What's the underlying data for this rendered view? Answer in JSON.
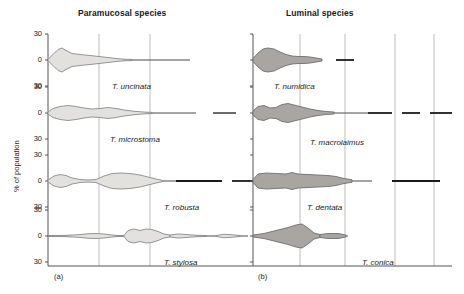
{
  "figure": {
    "width": 464,
    "height": 294,
    "y_axis_label": "% of population",
    "panels": [
      {
        "id": "a",
        "caption": "(a)",
        "title": "Paramucosal species",
        "fill_color": "#e3e1dd",
        "stroke_color": "#8a8a8a",
        "axis_x": 48,
        "right_x": 228,
        "gridlines": [
          99,
          150
        ],
        "rows": [
          {
            "species": "T. uncinata",
            "baseline_y": 60,
            "tick_labels": [
              "30",
              "0",
              "30"
            ],
            "label_x": 112,
            "label_y": 82,
            "profile": [
              {
                "x": 48,
                "w": 1.5
              },
              {
                "x": 53,
                "w": 11
              },
              {
                "x": 58,
                "w": 21
              },
              {
                "x": 62,
                "w": 24
              },
              {
                "x": 66,
                "w": 19
              },
              {
                "x": 72,
                "w": 13
              },
              {
                "x": 80,
                "w": 11
              },
              {
                "x": 90,
                "w": 9
              },
              {
                "x": 99,
                "w": 7
              },
              {
                "x": 108,
                "w": 5
              },
              {
                "x": 116,
                "w": 3
              },
              {
                "x": 124,
                "w": 1.6
              },
              {
                "x": 132,
                "w": 1.2
              }
            ],
            "line_end_x": 190
          },
          {
            "species": "T. microstoma",
            "baseline_y": 113,
            "tick_labels": [
              "30",
              "0",
              "30"
            ],
            "label_x": 110,
            "label_y": 135,
            "profile": [
              {
                "x": 48,
                "w": 2
              },
              {
                "x": 53,
                "w": 9
              },
              {
                "x": 60,
                "w": 13
              },
              {
                "x": 68,
                "w": 15
              },
              {
                "x": 76,
                "w": 13
              },
              {
                "x": 84,
                "w": 10
              },
              {
                "x": 92,
                "w": 8
              },
              {
                "x": 100,
                "w": 9
              },
              {
                "x": 108,
                "w": 11
              },
              {
                "x": 116,
                "w": 9
              },
              {
                "x": 124,
                "w": 6
              },
              {
                "x": 134,
                "w": 3.5
              },
              {
                "x": 144,
                "w": 1.8
              },
              {
                "x": 152,
                "w": 1.2
              }
            ],
            "line_end_x": 196,
            "extra_segments": [
              [
                213,
                236
              ]
            ]
          },
          {
            "species": "T. robusta",
            "baseline_y": 181,
            "tick_labels": [
              "30",
              "0",
              "30"
            ],
            "label_x": 164,
            "label_y": 203,
            "profile": [
              {
                "x": 48,
                "w": 2
              },
              {
                "x": 54,
                "w": 10
              },
              {
                "x": 60,
                "w": 13
              },
              {
                "x": 66,
                "w": 11
              },
              {
                "x": 72,
                "w": 6
              },
              {
                "x": 80,
                "w": 3
              },
              {
                "x": 88,
                "w": 2
              },
              {
                "x": 96,
                "w": 3
              },
              {
                "x": 104,
                "w": 10
              },
              {
                "x": 112,
                "w": 15
              },
              {
                "x": 120,
                "w": 16
              },
              {
                "x": 130,
                "w": 15
              },
              {
                "x": 140,
                "w": 12
              },
              {
                "x": 148,
                "w": 8
              },
              {
                "x": 156,
                "w": 4
              },
              {
                "x": 162,
                "w": 1.5
              }
            ],
            "line_end_x": 176,
            "dark_segments": [
              [
                176,
                222
              ],
              [
                232,
                260
              ]
            ]
          },
          {
            "species": "T. stylosa",
            "baseline_y": 236,
            "tick_labels": [
              "30",
              "0",
              "30"
            ],
            "label_x": 164,
            "label_y": 258,
            "profile": [
              {
                "x": 48,
                "w": 1
              },
              {
                "x": 64,
                "w": 1.2
              },
              {
                "x": 78,
                "w": 2.5
              },
              {
                "x": 88,
                "w": 4.5
              },
              {
                "x": 96,
                "w": 5
              },
              {
                "x": 104,
                "w": 4
              },
              {
                "x": 112,
                "w": 2
              },
              {
                "x": 118,
                "w": 1
              },
              {
                "x": 124,
                "w": 1
              }
            ],
            "profile2": [
              {
                "x": 124,
                "w": 1
              },
              {
                "x": 128,
                "w": 11
              },
              {
                "x": 134,
                "w": 14
              },
              {
                "x": 140,
                "w": 11
              },
              {
                "x": 146,
                "w": 14
              },
              {
                "x": 152,
                "w": 13
              },
              {
                "x": 158,
                "w": 9
              },
              {
                "x": 164,
                "w": 4
              },
              {
                "x": 170,
                "w": 2
              }
            ],
            "profile3": [
              {
                "x": 170,
                "w": 2
              },
              {
                "x": 178,
                "w": 4
              },
              {
                "x": 186,
                "w": 3
              },
              {
                "x": 196,
                "w": 1.5
              },
              {
                "x": 206,
                "w": 1
              }
            ],
            "profile4": [
              {
                "x": 216,
                "w": 1
              },
              {
                "x": 224,
                "w": 3.5
              },
              {
                "x": 232,
                "w": 2.5
              },
              {
                "x": 240,
                "w": 1
              }
            ],
            "line_end_x": 248
          }
        ]
      },
      {
        "id": "b",
        "caption": "(b)",
        "title": "Luminal species",
        "fill_color": "#a9a6a2",
        "stroke_color": "#6e6e6e",
        "axis_x": 253,
        "right_x": 450,
        "gridlines": [
          300,
          345,
          395,
          434
        ],
        "rows": [
          {
            "species": "T. numidica",
            "baseline_y": 60,
            "tick_labels": [
              "30",
              "0",
              "30"
            ],
            "label_x": 274,
            "label_y": 82,
            "profile": [
              {
                "x": 253,
                "w": 3
              },
              {
                "x": 258,
                "w": 14
              },
              {
                "x": 263,
                "w": 22
              },
              {
                "x": 268,
                "w": 24
              },
              {
                "x": 274,
                "w": 22
              },
              {
                "x": 280,
                "w": 16
              },
              {
                "x": 286,
                "w": 11
              },
              {
                "x": 292,
                "w": 8
              },
              {
                "x": 298,
                "w": 7
              },
              {
                "x": 304,
                "w": 7
              },
              {
                "x": 310,
                "w": 6
              },
              {
                "x": 316,
                "w": 4
              },
              {
                "x": 322,
                "w": 2
              }
            ],
            "line_end_x": 322,
            "dark_segments": [
              [
                336,
                354
              ]
            ]
          },
          {
            "species": "T. macrolaimus",
            "baseline_y": 113,
            "tick_labels": [
              "30",
              "0",
              "30"
            ],
            "label_x": 310,
            "label_y": 138,
            "profile": [
              {
                "x": 253,
                "w": 4
              },
              {
                "x": 258,
                "w": 13
              },
              {
                "x": 264,
                "w": 15
              },
              {
                "x": 270,
                "w": 10
              },
              {
                "x": 276,
                "w": 11
              },
              {
                "x": 282,
                "w": 17
              },
              {
                "x": 288,
                "w": 19
              },
              {
                "x": 294,
                "w": 16
              },
              {
                "x": 302,
                "w": 12
              },
              {
                "x": 310,
                "w": 8
              },
              {
                "x": 318,
                "w": 5
              },
              {
                "x": 326,
                "w": 3
              },
              {
                "x": 334,
                "w": 2
              }
            ],
            "line_end_x": 368,
            "dark_segments": [
              [
                368,
                392
              ],
              [
                402,
                420
              ],
              [
                430,
                452
              ]
            ]
          },
          {
            "species": "T. dentata",
            "baseline_y": 181,
            "tick_labels": [
              "30",
              "0",
              "30"
            ],
            "label_x": 307,
            "label_y": 203,
            "profile": [
              {
                "x": 253,
                "w": 3
              },
              {
                "x": 258,
                "w": 14
              },
              {
                "x": 266,
                "w": 16
              },
              {
                "x": 276,
                "w": 15
              },
              {
                "x": 286,
                "w": 14
              },
              {
                "x": 292,
                "w": 17
              },
              {
                "x": 298,
                "w": 14
              },
              {
                "x": 308,
                "w": 13
              },
              {
                "x": 318,
                "w": 12
              },
              {
                "x": 328,
                "w": 11
              },
              {
                "x": 336,
                "w": 9
              },
              {
                "x": 344,
                "w": 5
              },
              {
                "x": 352,
                "w": 2.5
              }
            ],
            "line_end_x": 372,
            "dark_segments": [
              [
                392,
                440
              ]
            ]
          },
          {
            "species": "T. conica",
            "baseline_y": 236,
            "tick_labels": [
              "30",
              "0",
              "30"
            ],
            "label_x": 362,
            "label_y": 258,
            "profile": [
              {
                "x": 253,
                "w": 2
              },
              {
                "x": 264,
                "w": 5
              },
              {
                "x": 276,
                "w": 11
              },
              {
                "x": 288,
                "w": 17
              },
              {
                "x": 296,
                "w": 22
              },
              {
                "x": 302,
                "w": 24
              },
              {
                "x": 308,
                "w": 16
              },
              {
                "x": 314,
                "w": 6
              },
              {
                "x": 320,
                "w": 3
              }
            ],
            "profile2": [
              {
                "x": 320,
                "w": 3
              },
              {
                "x": 328,
                "w": 5
              },
              {
                "x": 338,
                "w": 5
              },
              {
                "x": 346,
                "w": 2
              }
            ],
            "line_end_x": 348
          }
        ]
      }
    ],
    "colors": {
      "axis": "#555555",
      "gridline": "#bdbdbd",
      "dark_line": "#1a1a1a",
      "text": "#1a1a1a"
    }
  }
}
